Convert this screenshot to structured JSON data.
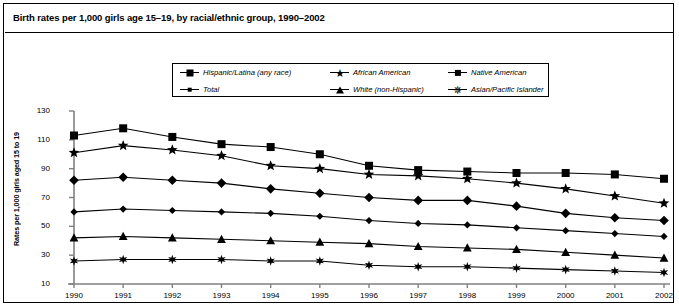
{
  "title": "Birth rates per 1,000 girls age 15–19, by racial/ethnic group, 1990–2002",
  "legend": {
    "items": [
      {
        "label": "Hispanic/Latina (any race)",
        "marker": "square-marker-icon"
      },
      {
        "label": "African American",
        "marker": "star5-marker-icon"
      },
      {
        "label": "Native American",
        "marker": "diamond-marker-icon"
      },
      {
        "label": "Total",
        "marker": "diamond-small-marker-icon"
      },
      {
        "label": "White (non-Hispanic)",
        "marker": "triangle-marker-icon"
      },
      {
        "label": "Asian/Pacific Islander",
        "marker": "star6-marker-icon"
      }
    ]
  },
  "chart_data": {
    "type": "line",
    "title": "Birth rates per 1,000 girls age 15–19, by racial/ethnic group, 1990–2002",
    "xlabel": "",
    "ylabel": "Rates per 1,000 girls aged 15 to 19",
    "categories": [
      "1990",
      "1991",
      "1992",
      "1993",
      "1994",
      "1995",
      "1996",
      "1997",
      "1998",
      "1999",
      "2000",
      "2001",
      "2002"
    ],
    "xticklabels": [
      "1990",
      "1991",
      "1992",
      "1993",
      "1994",
      "1995",
      "1996",
      "1997",
      "1998",
      "1999",
      "2000",
      "2001",
      "2002"
    ],
    "yticklabels": [
      "10",
      "30",
      "50",
      "70",
      "90",
      "110",
      "130"
    ],
    "yticks": [
      10,
      30,
      50,
      70,
      90,
      110,
      130
    ],
    "ylim": [
      10,
      130
    ],
    "grid": false,
    "legend_position": "top-center",
    "series": [
      {
        "name": "Hispanic/Latina (any race)",
        "marker": "square",
        "values": [
          113,
          118,
          112,
          107,
          105,
          100,
          92,
          89,
          88,
          87,
          87,
          86,
          83
        ]
      },
      {
        "name": "African American",
        "marker": "star5",
        "values": [
          101,
          106,
          103,
          99,
          92,
          90,
          86,
          85,
          83,
          80,
          76,
          71,
          66
        ]
      },
      {
        "name": "Native American",
        "marker": "diamond",
        "values": [
          82,
          84,
          82,
          80,
          76,
          73,
          70,
          68,
          68,
          64,
          59,
          56,
          54
        ]
      },
      {
        "name": "Total",
        "marker": "diamond-small",
        "values": [
          60,
          62,
          61,
          60,
          59,
          57,
          54,
          52,
          51,
          49,
          47,
          45,
          43
        ]
      },
      {
        "name": "White (non-Hispanic)",
        "marker": "triangle",
        "values": [
          42,
          43,
          42,
          41,
          40,
          39,
          38,
          36,
          35,
          34,
          32,
          30,
          28
        ]
      },
      {
        "name": "Asian/Pacific Islander",
        "marker": "star6",
        "values": [
          26,
          27,
          27,
          27,
          26,
          26,
          23,
          22,
          22,
          21,
          20,
          19,
          18
        ]
      }
    ]
  }
}
